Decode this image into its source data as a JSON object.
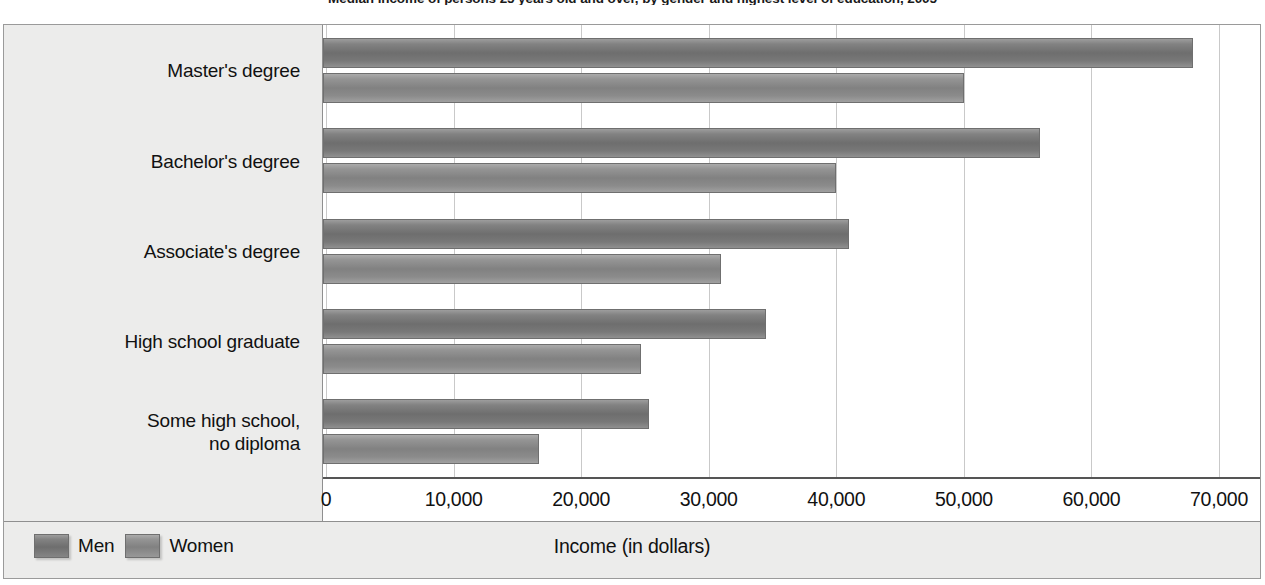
{
  "chart_data": {
    "type": "bar",
    "orientation": "horizontal",
    "title": "Median income of persons 25 years old and over, by gender and highest level of education, 2005",
    "xlabel": "Income (in dollars)",
    "ylabel": "",
    "categories": [
      "Master's degree",
      "Bachelor's degree",
      "Associate's degree",
      "High school graduate",
      "Some high school,\nno diploma"
    ],
    "series": [
      {
        "name": "Men",
        "values": [
          68000,
          56000,
          41000,
          34500,
          25300
        ]
      },
      {
        "name": "Women",
        "values": [
          50000,
          40000,
          31000,
          24700,
          16700
        ]
      }
    ],
    "xlim": [
      0,
      70000
    ],
    "xticks": [
      0,
      10000,
      20000,
      30000,
      40000,
      50000,
      60000,
      70000
    ],
    "xtick_labels": [
      "0",
      "10,000",
      "20,000",
      "30,000",
      "40,000",
      "50,000",
      "60,000",
      "70,000"
    ],
    "grid": "vertical",
    "legend_position": "bottom-left",
    "colors": {
      "men": "#6e6e6e",
      "women": "#818181",
      "panel": "#ececeb",
      "gridline": "#c9c9c9",
      "frame": "#9a9a9a",
      "text": "#111111"
    }
  },
  "legend": {
    "items": [
      {
        "label": "Men",
        "series": "men"
      },
      {
        "label": "Women",
        "series": "women"
      }
    ]
  }
}
